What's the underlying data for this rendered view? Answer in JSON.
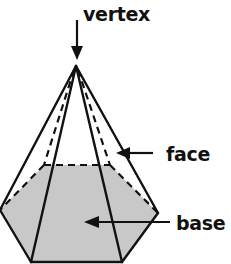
{
  "diagram": {
    "labels": {
      "vertex": "vertex",
      "face": "face",
      "base": "base"
    },
    "colors": {
      "line": "#111111",
      "base_fill": "#c8c8c8",
      "background": "#ffffff"
    }
  }
}
